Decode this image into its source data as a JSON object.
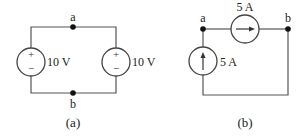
{
  "figure_a": {
    "caption": "(a)",
    "node_top": "a",
    "node_bottom": "b",
    "left_source": {
      "type": "voltage",
      "value": "10 V",
      "plus": "+",
      "minus": "−"
    },
    "right_source": {
      "type": "voltage",
      "value": "10 V",
      "plus": "+",
      "minus": "−"
    }
  },
  "figure_b": {
    "caption": "(b)",
    "node_left": "a",
    "node_right": "b",
    "vertical_source": {
      "type": "current",
      "value": "5 A",
      "direction": "up"
    },
    "horizontal_source": {
      "type": "current",
      "value": "5 A",
      "direction": "right"
    }
  },
  "colors": {
    "wire": "#555555",
    "text": "#222222"
  }
}
